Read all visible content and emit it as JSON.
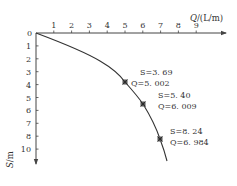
{
  "chart_data": {
    "type": "line",
    "title": "",
    "xlabel": "Q/(L/m)",
    "ylabel": "S/m",
    "x_axis_position": "top",
    "y_axis_inverted": true,
    "xlim": [
      0,
      10
    ],
    "ylim": [
      0,
      10
    ],
    "x_ticks": [
      "1",
      "2",
      "3",
      "4",
      "5",
      "6",
      "7",
      "8",
      "9"
    ],
    "y_ticks": [
      "0",
      "1",
      "2",
      "3",
      "4",
      "5",
      "6",
      "7",
      "8",
      "10"
    ],
    "origin_label": "0",
    "grid": false,
    "legend": null,
    "series": [
      {
        "name": "Q-S curve",
        "x": [
          0,
          1,
          2,
          3,
          4,
          5.002,
          6.009,
          6.984,
          7.4
        ],
        "y": [
          0,
          0.55,
          1.1,
          1.7,
          2.5,
          3.69,
          5.4,
          8.24,
          9.9
        ]
      }
    ],
    "marked_points": [
      {
        "S": "3.69",
        "Q": "5.002",
        "x": 5.002,
        "y": 3.69
      },
      {
        "S": "5.40",
        "Q": "6.009",
        "x": 6.009,
        "y": 5.4
      },
      {
        "S": "8.24",
        "Q": "6.984",
        "x": 6.984,
        "y": 8.24
      }
    ],
    "annotations": [
      {
        "line1": "S=3. 69",
        "line2": "Q=5. 002"
      },
      {
        "line1": "S=5. 40",
        "line2": "Q=6. 009"
      },
      {
        "line1": "S=8. 24",
        "line2": "Q=6. 984"
      }
    ]
  },
  "labels": {
    "x_axis": "Q/(L/m)",
    "y_axis": "S/m",
    "origin": "0",
    "ann1_s": "S=3. 69",
    "ann1_q": "Q=5. 002",
    "ann2_s": "S=5. 40",
    "ann2_q": "Q=6. 009",
    "ann3_s": "S=8. 24",
    "ann3_q": "Q=6. 984"
  },
  "colors": {
    "axis": "#444444",
    "curve": "#333333",
    "text": "#333333"
  }
}
